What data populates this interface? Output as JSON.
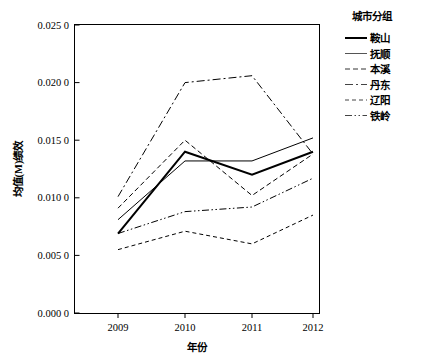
{
  "chart_data": {
    "type": "line",
    "title": "",
    "xlabel": "年份",
    "ylabel": "均值(M)绩效",
    "categories": [
      "2009",
      "2010",
      "2011",
      "2012"
    ],
    "x": [
      2009,
      2010,
      2011,
      2012
    ],
    "xlim": [
      2008.6,
      2012.4
    ],
    "ylim": [
      0.0,
      0.025
    ],
    "yticks": [
      "0.000 0",
      "0.005 0",
      "0.010 0",
      "0.015 0",
      "0.020 0",
      "0.025 0"
    ],
    "ytick_values": [
      0.0,
      0.005,
      0.01,
      0.015,
      0.02,
      0.025
    ],
    "xticks": [
      "2009",
      "2010",
      "2011",
      "2012"
    ],
    "grid": false,
    "legend_position": "right",
    "legend_title": "城市分组",
    "series": [
      {
        "name": "鞍山",
        "values": [
          0.0069,
          0.014,
          0.012,
          0.014
        ],
        "style": "solid",
        "width": 2.0,
        "dash": "none",
        "color": "#000000"
      },
      {
        "name": "抚顺",
        "values": [
          0.0081,
          0.0132,
          0.0132,
          0.0152
        ],
        "style": "solid",
        "width": 1.0,
        "dash": "none",
        "color": "#555555"
      },
      {
        "name": "本溪",
        "values": [
          0.0091,
          0.015,
          0.0102,
          0.0138
        ],
        "style": "dashed",
        "width": 1.0,
        "dash": "5,3",
        "color": "#333333"
      },
      {
        "name": "丹东",
        "values": [
          0.0101,
          0.02,
          0.0206,
          0.0138
        ],
        "style": "dash-dot",
        "width": 1.0,
        "dash": "8,3,2,3",
        "color": "#444444"
      },
      {
        "name": "辽阳",
        "values": [
          0.0055,
          0.0071,
          0.006,
          0.0085
        ],
        "style": "dashed-short",
        "width": 1.0,
        "dash": "4,3",
        "color": "#444444"
      },
      {
        "name": "铁岭",
        "values": [
          0.0069,
          0.0088,
          0.0092,
          0.0117
        ],
        "style": "dash-dot-dot",
        "width": 1.0,
        "dash": "7,2.5,1.5,2.5,1.5,2.5",
        "color": "#444444"
      }
    ]
  },
  "legend": {
    "title": "城市分组",
    "items": [
      {
        "label": "鞍山"
      },
      {
        "label": "抚顺"
      },
      {
        "label": "本溪"
      },
      {
        "label": "丹东"
      },
      {
        "label": "辽阳"
      },
      {
        "label": "铁岭"
      }
    ]
  },
  "axes": {
    "y_title": "均值(M)绩效",
    "x_title": "年份",
    "y_labels": [
      "0.025 0",
      "0.020 0",
      "0.015 0",
      "0.010 0",
      "0.005 0",
      "0.000 0"
    ],
    "x_labels": [
      "2009",
      "2010",
      "2011",
      "2012"
    ]
  }
}
